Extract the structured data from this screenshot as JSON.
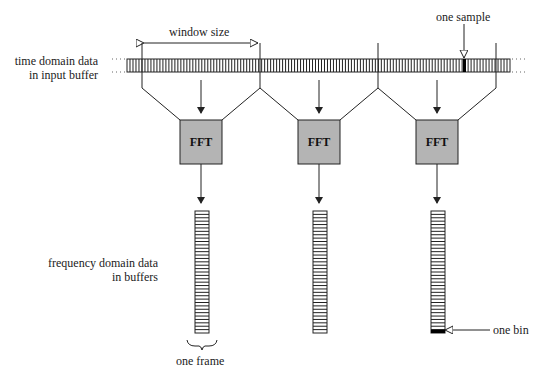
{
  "labels": {
    "window_size": "window size",
    "one_sample": "one sample",
    "time_domain_line1": "time domain data",
    "time_domain_line2": "in input buffer",
    "freq_domain_line1": "frequency domain data",
    "freq_domain_line2": "in buffers",
    "one_frame": "one frame",
    "one_bin": "one bin"
  },
  "fft_blocks": [
    {
      "label": "FFT"
    },
    {
      "label": "FFT"
    },
    {
      "label": "FFT"
    }
  ],
  "colors": {
    "fft_fill": "#b4b4b4",
    "stroke": "#222222",
    "highlight": "#000000"
  },
  "geometry": {
    "input_buffer_cells": 128,
    "frequency_buffer_bins": 36,
    "window_boundaries_x": [
      142,
      260,
      378,
      496
    ]
  }
}
